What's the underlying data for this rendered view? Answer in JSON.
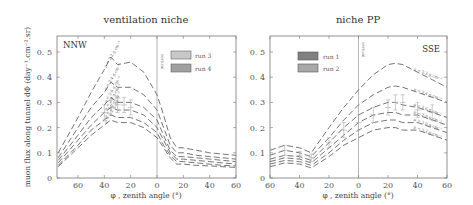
{
  "chart_data": [
    {
      "type": "line",
      "title": "ventilation niche",
      "direction_label": "NNW",
      "xlabel": "φ , zenith angle (°)",
      "ylabel": "muon flux along tunnel dΦ (day⁻¹.cm⁻².sr)",
      "x_ticks": [
        "60",
        "40",
        "20",
        "0",
        "20",
        "40",
        "60"
      ],
      "y_ticks": [
        "0",
        "0.1",
        "0.2",
        "0.3",
        "0.4",
        "0.5"
      ],
      "ylim": [
        0,
        0.55
      ],
      "vertical_marker": "vertical",
      "legend": [
        {
          "label": "run 3",
          "color": "#c8c8c8"
        },
        {
          "label": "run 4",
          "color": "#a0a0a0"
        }
      ],
      "x": [
        -75,
        -60,
        -50,
        -40,
        -35,
        -30,
        -20,
        -10,
        0,
        5,
        10,
        15,
        20,
        30,
        40,
        50,
        60
      ],
      "series": [
        {
          "name": "ρ = 2.2 g.cm⁻³",
          "values": [
            0.1,
            0.24,
            0.34,
            0.43,
            0.48,
            0.45,
            0.46,
            0.42,
            0.33,
            0.25,
            0.16,
            0.12,
            0.12,
            0.11,
            0.1,
            0.095,
            0.09
          ]
        },
        {
          "name": "ρ = 2.4 g.cm⁻³",
          "values": [
            0.08,
            0.2,
            0.28,
            0.34,
            0.38,
            0.36,
            0.36,
            0.33,
            0.27,
            0.2,
            0.13,
            0.1,
            0.1,
            0.09,
            0.085,
            0.08,
            0.075
          ]
        },
        {
          "name": "ρ = 2.6 g.cm⁻³",
          "values": [
            0.07,
            0.17,
            0.24,
            0.29,
            0.32,
            0.3,
            0.3,
            0.28,
            0.23,
            0.17,
            0.11,
            0.085,
            0.085,
            0.08,
            0.075,
            0.07,
            0.065
          ]
        },
        {
          "name": "ρ = 2.8 g.cm⁻³",
          "values": [
            0.06,
            0.15,
            0.21,
            0.26,
            0.28,
            0.27,
            0.27,
            0.25,
            0.2,
            0.15,
            0.1,
            0.075,
            0.075,
            0.07,
            0.065,
            0.06,
            0.055
          ]
        },
        {
          "name": "ρ = 3.0 g.cm⁻³",
          "values": [
            0.05,
            0.13,
            0.19,
            0.23,
            0.25,
            0.24,
            0.24,
            0.22,
            0.18,
            0.13,
            0.09,
            0.065,
            0.065,
            0.06,
            0.055,
            0.05,
            0.048
          ]
        },
        {
          "name": "ρ = 3.2 g.cm⁻³",
          "values": [
            0.045,
            0.12,
            0.17,
            0.21,
            0.23,
            0.22,
            0.22,
            0.2,
            0.16,
            0.12,
            0.08,
            0.055,
            0.055,
            0.05,
            0.048,
            0.045,
            0.042
          ]
        }
      ],
      "measured": [
        {
          "x": -40,
          "y": 0.26,
          "err": 0.03
        },
        {
          "x": -35,
          "y": 0.28,
          "err": 0.03
        },
        {
          "x": -30,
          "y": 0.29,
          "err": 0.03
        },
        {
          "x": -25,
          "y": 0.29,
          "err": 0.03
        },
        {
          "x": -20,
          "y": 0.28,
          "err": 0.03
        }
      ]
    },
    {
      "type": "line",
      "title": "niche PP",
      "direction_label": "SSE",
      "xlabel": "φ , zenith angle (°)",
      "x_ticks": [
        "60",
        "40",
        "20",
        "0",
        "20",
        "40",
        "60"
      ],
      "y_ticks": [
        "0",
        "0.1",
        "0.2",
        "0.3",
        "0.4",
        "0.5"
      ],
      "ylim": [
        0,
        0.55
      ],
      "vertical_marker": "vertical",
      "legend": [
        {
          "label": "run 1",
          "color": "#808080"
        },
        {
          "label": "run 2",
          "color": "#a8a8a8"
        }
      ],
      "x": [
        -60,
        -50,
        -40,
        -32,
        -20,
        -10,
        0,
        10,
        20,
        25,
        30,
        40,
        50,
        60
      ],
      "series": [
        {
          "name": "ρ = 2.2 g.cm⁻³",
          "values": [
            0.11,
            0.13,
            0.12,
            0.1,
            0.2,
            0.28,
            0.35,
            0.41,
            0.45,
            0.455,
            0.45,
            0.42,
            0.39,
            0.36
          ]
        },
        {
          "name": "ρ = 2.4 g.cm⁻³",
          "values": [
            0.09,
            0.11,
            0.1,
            0.085,
            0.16,
            0.23,
            0.29,
            0.33,
            0.36,
            0.365,
            0.36,
            0.34,
            0.32,
            0.3
          ]
        },
        {
          "name": "ρ = 2.6 g.cm⁻³",
          "values": [
            0.075,
            0.09,
            0.085,
            0.07,
            0.14,
            0.2,
            0.25,
            0.28,
            0.3,
            0.3,
            0.29,
            0.28,
            0.26,
            0.24
          ]
        },
        {
          "name": "ρ = 2.8 g.cm⁻³",
          "values": [
            0.065,
            0.08,
            0.075,
            0.06,
            0.12,
            0.17,
            0.22,
            0.25,
            0.26,
            0.26,
            0.25,
            0.25,
            0.23,
            0.21
          ]
        },
        {
          "name": "ρ = 3.0 g.cm⁻³",
          "values": [
            0.055,
            0.07,
            0.065,
            0.05,
            0.1,
            0.15,
            0.19,
            0.22,
            0.23,
            0.23,
            0.22,
            0.22,
            0.2,
            0.18
          ]
        },
        {
          "name": "ρ = 3.2 g.cm⁻³",
          "values": [
            0.045,
            0.06,
            0.055,
            0.04,
            0.085,
            0.13,
            0.16,
            0.19,
            0.2,
            0.2,
            0.19,
            0.19,
            0.17,
            0.15
          ]
        }
      ],
      "measured": [
        {
          "x": -50,
          "y": 0.11,
          "err": 0.02
        },
        {
          "x": -40,
          "y": 0.09,
          "err": 0.015
        },
        {
          "x": -32,
          "y": 0.08,
          "err": 0.015
        },
        {
          "x": -20,
          "y": 0.14,
          "err": 0.02
        },
        {
          "x": -10,
          "y": 0.19,
          "err": 0.03
        },
        {
          "x": 0,
          "y": 0.22,
          "err": 0.03
        },
        {
          "x": 10,
          "y": 0.25,
          "err": 0.03
        },
        {
          "x": 20,
          "y": 0.28,
          "err": 0.03
        },
        {
          "x": 25,
          "y": 0.3,
          "err": 0.03
        },
        {
          "x": 30,
          "y": 0.3,
          "err": 0.03
        },
        {
          "x": 40,
          "y": 0.27,
          "err": 0.03
        },
        {
          "x": 50,
          "y": 0.26,
          "err": 0.03
        }
      ]
    }
  ],
  "labels": {
    "left_title": "ventilation niche",
    "right_title": "niche PP",
    "left_tag": "NNW",
    "right_tag": "SSE",
    "vertical": "vertical",
    "xlabel": "φ , zenith angle (°)",
    "ylabel": "muon flux along tunnel dΦ (day⁻¹.cm⁻².sr)",
    "left_legend": [
      "run 3",
      "run 4"
    ],
    "right_legend": [
      "run 1",
      "run 2"
    ]
  }
}
